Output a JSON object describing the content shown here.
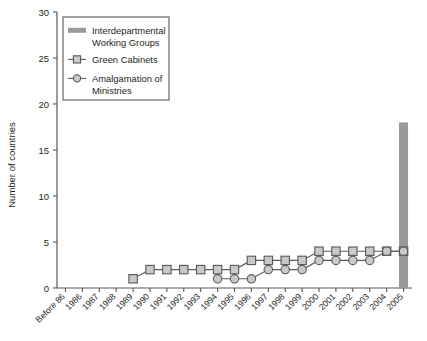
{
  "chart_data": {
    "type": "line",
    "title": "",
    "xlabel": "",
    "ylabel": "Number of countries",
    "ylim": [
      0,
      30
    ],
    "yticks": [
      0,
      5,
      10,
      15,
      20,
      25,
      30
    ],
    "grid": false,
    "legend_position": "top-left",
    "categories": [
      "Before 86",
      "1986",
      "1987",
      "1988",
      "1989",
      "1990",
      "1991",
      "1992",
      "1993",
      "1994",
      "1995",
      "1996",
      "1997",
      "1998",
      "1999",
      "2000",
      "2001",
      "2002",
      "2003",
      "2004",
      "2005"
    ],
    "series": [
      {
        "name": "Interdepartmental Working Groups",
        "type": "bar",
        "color": "#9a9a9a",
        "values": [
          null,
          null,
          null,
          null,
          null,
          null,
          null,
          null,
          null,
          null,
          null,
          null,
          null,
          null,
          null,
          null,
          null,
          null,
          null,
          null,
          18
        ]
      },
      {
        "name": "Green Cabinets",
        "type": "line",
        "marker": "square",
        "color": "#c9c9c9",
        "values": [
          null,
          null,
          null,
          null,
          1,
          2,
          2,
          2,
          2,
          2,
          2,
          3,
          3,
          3,
          3,
          4,
          4,
          4,
          4,
          4,
          4
        ]
      },
      {
        "name": "Amalgamation of Ministries",
        "type": "line",
        "marker": "circle",
        "color": "#c9c9c9",
        "values": [
          null,
          null,
          null,
          null,
          null,
          null,
          null,
          null,
          null,
          1,
          1,
          1,
          2,
          2,
          2,
          3,
          3,
          3,
          3,
          4,
          4
        ]
      }
    ]
  },
  "legend": {
    "items": [
      {
        "label_line1": "Interdepartmental",
        "label_line2": "Working Groups",
        "marker": "bar-swatch"
      },
      {
        "label_line1": "Green Cabinets",
        "label_line2": "",
        "marker": "square"
      },
      {
        "label_line1": "Amalgamation of",
        "label_line2": "Ministries",
        "marker": "circle"
      }
    ]
  },
  "axes": {
    "y_label": "Number of countries",
    "y_ticks": [
      "0",
      "5",
      "10",
      "15",
      "20",
      "25",
      "30"
    ],
    "x_ticks": [
      "Before 86",
      "1986",
      "1987",
      "1988",
      "1989",
      "1990",
      "1991",
      "1992",
      "1993",
      "1994",
      "1995",
      "1996",
      "1997",
      "1998",
      "1999",
      "2000",
      "2001",
      "2002",
      "2003",
      "2004",
      "2005"
    ]
  }
}
